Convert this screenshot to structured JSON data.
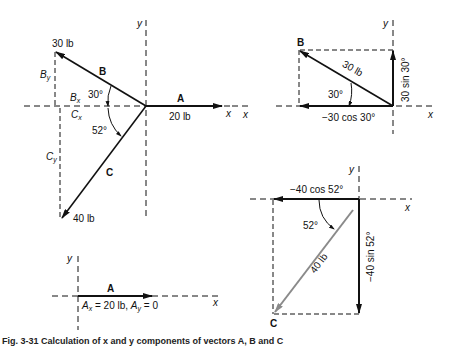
{
  "figure": {
    "caption": "Fig. 3-31  Calculation of x and y components of vectors A, B and C"
  },
  "panel_main": {
    "axis_x": "x",
    "axis_y": "y",
    "vector_a": {
      "name": "A",
      "magnitude": "20 lb"
    },
    "vector_b": {
      "name": "B",
      "magnitude": "30 lb",
      "angle": "30°"
    },
    "vector_c": {
      "name": "C",
      "magnitude": "40 lb",
      "angle": "52°"
    },
    "bx": "B",
    "bx_sub": "x",
    "by": "B",
    "by_sub": "y",
    "cx": "C",
    "cx_sub": "x",
    "cy": "C",
    "cy_sub": "y"
  },
  "panel_b": {
    "axis_x_left": "x",
    "axis_x_right": "x",
    "axis_y": "y",
    "vector_name": "B",
    "magnitude": "30 lb",
    "angle": "30°",
    "x_component": "−30 cos 30°",
    "y_component": "30 sin 30°"
  },
  "panel_c": {
    "axis_x": "x",
    "axis_y": "y",
    "vector_name": "C",
    "magnitude": "40 lb",
    "angle": "52°",
    "x_component": "−40 cos 52°",
    "y_component": "−40 sin 52°"
  },
  "panel_a": {
    "axis_x": "x",
    "axis_y": "y",
    "vector_name": "A",
    "components_text_1": "A",
    "components_sub_1": "x",
    "components_text_2": " = 20 lb, ",
    "components_text_3": "A",
    "components_sub_3": "y",
    "components_text_4": " = 0"
  },
  "colors": {
    "ink": "#111111",
    "vector_c_gray": "#8a8a8a",
    "background": "#ffffff"
  }
}
